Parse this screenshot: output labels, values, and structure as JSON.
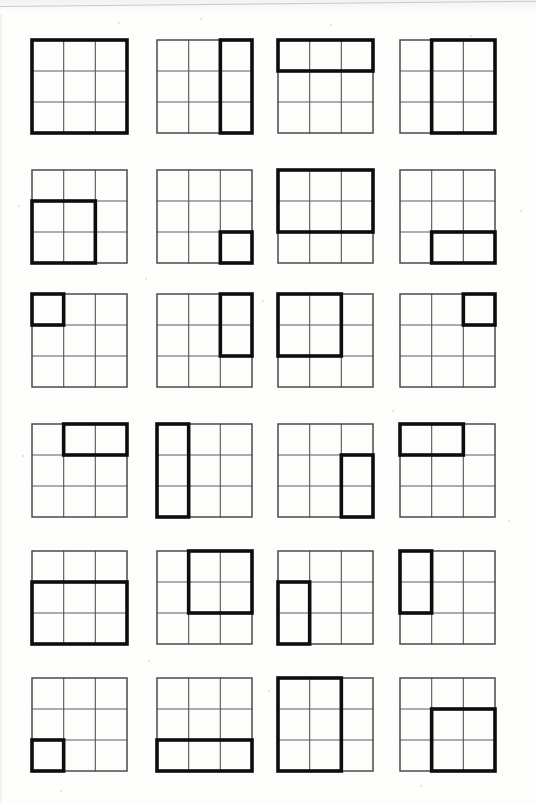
{
  "page": {
    "background_color": "#fdfdfc",
    "thin_line_color": "#5c5c5c",
    "bold_line_color": "#0d0d0d",
    "grid_rows": 3,
    "grid_cols": 3,
    "array_rows": 6,
    "array_cols": 4,
    "total_figures": 24
  },
  "layout": {
    "column_x": [
      32,
      157,
      278,
      400
    ],
    "row_y": [
      40,
      170,
      294,
      424,
      551,
      678
    ],
    "cell_width": 31.7,
    "cell_height": 31,
    "grid_width": 95,
    "grid_height": 93
  },
  "figures": [
    {
      "index": 1,
      "row": 1,
      "col": 1,
      "label": "full-grid",
      "region": {
        "r0": 0,
        "c0": 0,
        "r1": 3,
        "c1": 3
      }
    },
    {
      "index": 2,
      "row": 1,
      "col": 2,
      "label": "right-column",
      "region": {
        "r0": 0,
        "c0": 2,
        "r1": 3,
        "c1": 3
      }
    },
    {
      "index": 3,
      "row": 1,
      "col": 3,
      "label": "top-row",
      "region": {
        "r0": 0,
        "c0": 0,
        "r1": 1,
        "c1": 3
      }
    },
    {
      "index": 4,
      "row": 1,
      "col": 4,
      "label": "right-two-columns",
      "region": {
        "r0": 0,
        "c0": 1,
        "r1": 3,
        "c1": 3
      }
    },
    {
      "index": 5,
      "row": 2,
      "col": 1,
      "label": "bottom-left-2x2",
      "region": {
        "r0": 1,
        "c0": 0,
        "r1": 3,
        "c1": 2
      }
    },
    {
      "index": 6,
      "row": 2,
      "col": 2,
      "label": "bottom-right-cell",
      "region": {
        "r0": 2,
        "c0": 2,
        "r1": 3,
        "c1": 3
      }
    },
    {
      "index": 7,
      "row": 2,
      "col": 3,
      "label": "top-two-rows",
      "region": {
        "r0": 0,
        "c0": 0,
        "r1": 2,
        "c1": 3
      }
    },
    {
      "index": 8,
      "row": 2,
      "col": 4,
      "label": "bottom-row-right-two",
      "region": {
        "r0": 2,
        "c0": 1,
        "r1": 3,
        "c1": 3
      }
    },
    {
      "index": 9,
      "row": 3,
      "col": 1,
      "label": "top-left-cell",
      "region": {
        "r0": 0,
        "c0": 0,
        "r1": 1,
        "c1": 1
      }
    },
    {
      "index": 10,
      "row": 3,
      "col": 2,
      "label": "right-column-top-two",
      "region": {
        "r0": 0,
        "c0": 2,
        "r1": 2,
        "c1": 3
      }
    },
    {
      "index": 11,
      "row": 3,
      "col": 3,
      "label": "top-left-2x2",
      "region": {
        "r0": 0,
        "c0": 0,
        "r1": 2,
        "c1": 2
      }
    },
    {
      "index": 12,
      "row": 3,
      "col": 4,
      "label": "top-right-cell",
      "region": {
        "r0": 0,
        "c0": 2,
        "r1": 1,
        "c1": 3
      }
    },
    {
      "index": 13,
      "row": 4,
      "col": 1,
      "label": "top-row-right-two",
      "region": {
        "r0": 0,
        "c0": 1,
        "r1": 1,
        "c1": 3
      }
    },
    {
      "index": 14,
      "row": 4,
      "col": 2,
      "label": "left-column",
      "region": {
        "r0": 0,
        "c0": 0,
        "r1": 3,
        "c1": 1
      }
    },
    {
      "index": 15,
      "row": 4,
      "col": 3,
      "label": "right-column-bot-two",
      "region": {
        "r0": 1,
        "c0": 2,
        "r1": 3,
        "c1": 3
      }
    },
    {
      "index": 16,
      "row": 4,
      "col": 4,
      "label": "top-row-left-two",
      "region": {
        "r0": 0,
        "c0": 0,
        "r1": 1,
        "c1": 2
      }
    },
    {
      "index": 17,
      "row": 5,
      "col": 1,
      "label": "bottom-two-rows",
      "region": {
        "r0": 1,
        "c0": 0,
        "r1": 3,
        "c1": 3
      }
    },
    {
      "index": 18,
      "row": 5,
      "col": 2,
      "label": "top-right-2x2",
      "region": {
        "r0": 0,
        "c0": 1,
        "r1": 2,
        "c1": 3
      }
    },
    {
      "index": 19,
      "row": 5,
      "col": 3,
      "label": "left-column-bot-two",
      "region": {
        "r0": 1,
        "c0": 0,
        "r1": 3,
        "c1": 1
      }
    },
    {
      "index": 20,
      "row": 5,
      "col": 4,
      "label": "left-column-top-two",
      "region": {
        "r0": 0,
        "c0": 0,
        "r1": 2,
        "c1": 1
      }
    },
    {
      "index": 21,
      "row": 6,
      "col": 1,
      "label": "bottom-left-cell",
      "region": {
        "r0": 2,
        "c0": 0,
        "r1": 3,
        "c1": 1
      }
    },
    {
      "index": 22,
      "row": 6,
      "col": 2,
      "label": "bottom-row",
      "region": {
        "r0": 2,
        "c0": 0,
        "r1": 3,
        "c1": 3
      }
    },
    {
      "index": 23,
      "row": 6,
      "col": 3,
      "label": "left-two-columns",
      "region": {
        "r0": 0,
        "c0": 0,
        "r1": 3,
        "c1": 2
      }
    },
    {
      "index": 24,
      "row": 6,
      "col": 4,
      "label": "bottom-right-2x2",
      "region": {
        "r0": 1,
        "c0": 1,
        "r1": 3,
        "c1": 3
      }
    }
  ],
  "specks": [
    {
      "x": 118,
      "y": 22,
      "d": 2
    },
    {
      "x": 200,
      "y": 18,
      "d": 2
    },
    {
      "x": 330,
      "y": 24,
      "d": 2
    },
    {
      "x": 470,
      "y": 35,
      "d": 2
    },
    {
      "x": 18,
      "y": 205,
      "d": 2
    },
    {
      "x": 520,
      "y": 210,
      "d": 2
    },
    {
      "x": 145,
      "y": 278,
      "d": 2
    },
    {
      "x": 262,
      "y": 300,
      "d": 2
    },
    {
      "x": 392,
      "y": 410,
      "d": 2
    },
    {
      "x": 22,
      "y": 455,
      "d": 2
    },
    {
      "x": 508,
      "y": 520,
      "d": 2
    },
    {
      "x": 148,
      "y": 660,
      "d": 2
    },
    {
      "x": 268,
      "y": 690,
      "d": 2
    },
    {
      "x": 60,
      "y": 790,
      "d": 2
    },
    {
      "x": 420,
      "y": 785,
      "d": 2
    }
  ]
}
